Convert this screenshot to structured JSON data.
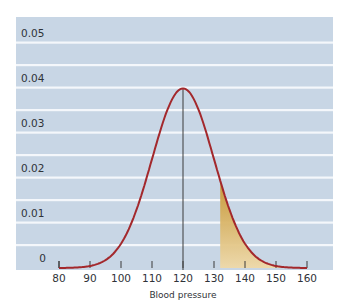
{
  "chart_data": {
    "type": "area",
    "title": "",
    "xlabel": "Blood pressure",
    "ylabel": "",
    "xlim": [
      80,
      160
    ],
    "ylim": [
      0,
      0.05
    ],
    "x_ticks": [
      80,
      90,
      100,
      110,
      120,
      130,
      140,
      150,
      160
    ],
    "y_ticks": [
      0,
      0.01,
      0.02,
      0.03,
      0.04,
      0.05
    ],
    "y_tick_labels": [
      "0",
      "0.01",
      "0.02",
      "0.03",
      "0.04",
      "0.05"
    ],
    "x_tick_labels": [
      "80",
      "90",
      "100",
      "110",
      "120",
      "130",
      "140",
      "150",
      "160"
    ],
    "grid": true,
    "legend": null,
    "series": [
      {
        "name": "Normal density",
        "distribution": "normal",
        "mean": 120,
        "sd": 10,
        "peak": 0.0399,
        "x": [
          80,
          85,
          90,
          95,
          100,
          105,
          110,
          115,
          120,
          125,
          130,
          132,
          135,
          140,
          145,
          150,
          155,
          160
        ],
        "values": [
          0.0001,
          0.0004,
          0.0004,
          0.0018,
          0.0054,
          0.013,
          0.0242,
          0.0352,
          0.0399,
          0.0352,
          0.0242,
          0.0194,
          0.013,
          0.0054,
          0.0018,
          0.0004,
          0.0001,
          0.0001
        ]
      }
    ],
    "annotations": [
      {
        "type": "vertical-line",
        "x": 120,
        "label": "mean"
      },
      {
        "type": "shaded-region",
        "from": 132,
        "to": 160,
        "label": "upper tail"
      }
    ]
  },
  "colors": {
    "panel": "#c8d6e5",
    "gridline": "#f4f7fb",
    "curve": "#a3282c",
    "mean_line": "#3a3a3a",
    "shade_top": "#c7952f",
    "shade_bottom": "#efd9a8",
    "text": "#2f3338"
  }
}
